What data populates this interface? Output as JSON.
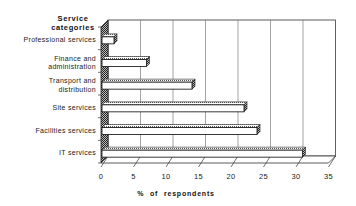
{
  "chart_data": {
    "type": "bar",
    "orientation": "horizontal",
    "style": "3d-hatched",
    "title": "",
    "ylabel": "Service categories",
    "xlabel": "% of respondents",
    "categories": [
      "Professional services",
      "Finance and administration",
      "Transport and distribution",
      "Site services",
      "Facilities services",
      "IT services"
    ],
    "category_label_lines": [
      [
        "Professional services"
      ],
      [
        "Finance and",
        "administration"
      ],
      [
        "Transport and",
        "distribution"
      ],
      [
        "Site services"
      ],
      [
        "Facilities services"
      ],
      [
        "IT services"
      ]
    ],
    "values": [
      2,
      7,
      14,
      22,
      24,
      31
    ],
    "xlim": [
      0,
      35
    ],
    "xticks": [
      0,
      5,
      10,
      15,
      20,
      25,
      30,
      35
    ],
    "grid": true,
    "legend": null
  },
  "colors": {
    "bar_face": "#ffffff",
    "bar_edge": "#222222",
    "bar_hatch": "#555555",
    "grid": "#666666",
    "wall": "#444444"
  }
}
